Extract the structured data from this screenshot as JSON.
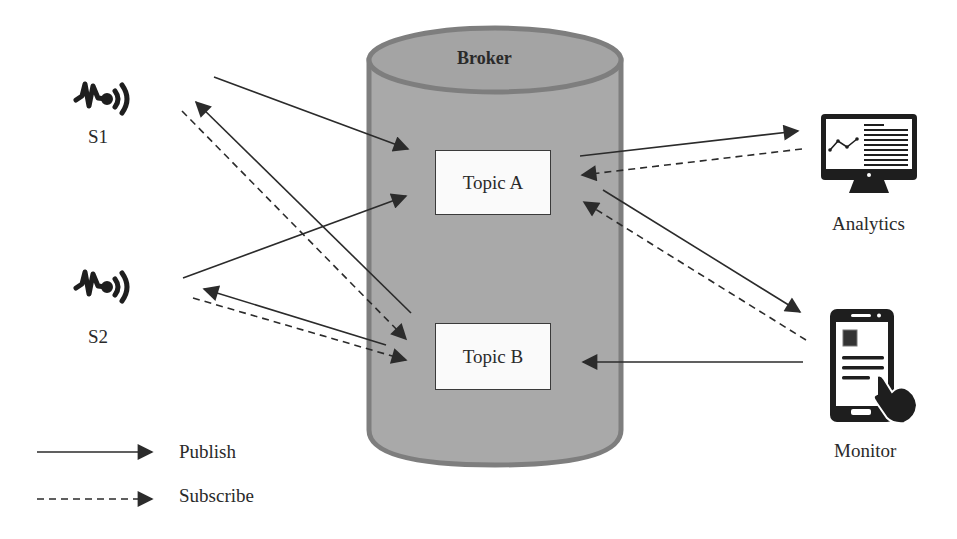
{
  "broker": {
    "title": "Broker",
    "fill": "#a9a9a9",
    "stroke": "#7e7e7e",
    "topics": [
      {
        "id": "topic-a",
        "label": "Topic A"
      },
      {
        "id": "topic-b",
        "label": "Topic B"
      }
    ]
  },
  "publishers": [
    {
      "id": "s1",
      "label": "S1",
      "icon": "sensor-signal-icon"
    },
    {
      "id": "s2",
      "label": "S2",
      "icon": "sensor-signal-icon"
    }
  ],
  "clients": [
    {
      "id": "analytics",
      "label": "Analytics",
      "icon": "monitor-chart-icon"
    },
    {
      "id": "monitor",
      "label": "Monitor",
      "icon": "smartphone-touch-icon"
    }
  ],
  "connections": [
    {
      "from": "S1",
      "to": "Topic A",
      "type": "publish"
    },
    {
      "from": "Topic B",
      "to": "S1",
      "type": "publish"
    },
    {
      "from": "S1",
      "to": "Topic B",
      "type": "subscribe"
    },
    {
      "from": "S2",
      "to": "Topic A",
      "type": "publish"
    },
    {
      "from": "Topic B",
      "to": "S2",
      "type": "publish"
    },
    {
      "from": "S2",
      "to": "Topic B",
      "type": "subscribe"
    },
    {
      "from": "Topic A",
      "to": "Analytics",
      "type": "publish"
    },
    {
      "from": "Analytics",
      "to": "Topic A",
      "type": "subscribe"
    },
    {
      "from": "Topic A",
      "to": "Monitor",
      "type": "publish"
    },
    {
      "from": "Monitor",
      "to": "Topic A",
      "type": "subscribe"
    },
    {
      "from": "Monitor",
      "to": "Topic B",
      "type": "publish"
    }
  ],
  "legend": {
    "items": [
      {
        "style": "solid",
        "label": "Publish"
      },
      {
        "style": "dashed",
        "label": "Subscribe"
      }
    ]
  },
  "colors": {
    "line": "#2b2b2b",
    "icon": "#1e1e1e"
  }
}
